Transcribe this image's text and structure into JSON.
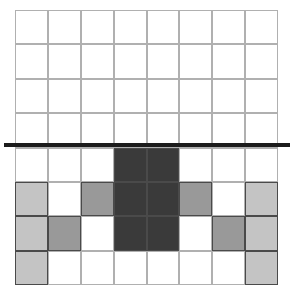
{
  "figure": {
    "name": "shaded-grid-with-threshold-line",
    "canvas": {
      "width": 292,
      "height": 297,
      "background": "#ffffff"
    },
    "grid": {
      "rows": 8,
      "columns": 8,
      "left": 15,
      "top": 10,
      "width": 263,
      "height": 275,
      "cell_width": 32.9,
      "cell_height": 34.4,
      "line_color": "#b0b0b0",
      "shaded_cell_border_color": "#4a4a4a"
    },
    "threshold_line": {
      "label": "threshold-line",
      "y": 145,
      "x_start": 4,
      "x_end": 290,
      "thickness": 4,
      "color": "#1c1c1c",
      "row_index_below": 4,
      "extends_past_grid": true
    },
    "palette": {
      "empty": "#ffffff",
      "light": "#c4c4c4",
      "medium": "#999999",
      "dark": "#3a3a3a"
    },
    "legend_keys": [
      "empty",
      "light",
      "medium",
      "dark"
    ]
  },
  "chart_data": {
    "type": "heatmap",
    "title": "",
    "xlabel": "",
    "ylabel": "",
    "grid": true,
    "legend": "none",
    "categories_x": [
      "1",
      "2",
      "3",
      "4",
      "5",
      "6",
      "7",
      "8"
    ],
    "categories_y": [
      "1",
      "2",
      "3",
      "4",
      "5",
      "6",
      "7",
      "8"
    ],
    "value_levels": {
      "empty": 0,
      "light": 1,
      "medium": 2,
      "dark": 3
    },
    "cells": [
      [
        "empty",
        "empty",
        "empty",
        "empty",
        "empty",
        "empty",
        "empty",
        "empty"
      ],
      [
        "empty",
        "empty",
        "empty",
        "empty",
        "empty",
        "empty",
        "empty",
        "empty"
      ],
      [
        "empty",
        "empty",
        "empty",
        "empty",
        "empty",
        "empty",
        "empty",
        "empty"
      ],
      [
        "empty",
        "empty",
        "empty",
        "empty",
        "empty",
        "empty",
        "empty",
        "empty"
      ],
      [
        "empty",
        "empty",
        "empty",
        "dark",
        "dark",
        "empty",
        "empty",
        "empty"
      ],
      [
        "light",
        "empty",
        "medium",
        "dark",
        "dark",
        "medium",
        "empty",
        "light"
      ],
      [
        "light",
        "medium",
        "empty",
        "dark",
        "dark",
        "empty",
        "medium",
        "light"
      ],
      [
        "light",
        "empty",
        "empty",
        "empty",
        "empty",
        "empty",
        "empty",
        "light"
      ]
    ],
    "values": [
      [
        0,
        0,
        0,
        0,
        0,
        0,
        0,
        0
      ],
      [
        0,
        0,
        0,
        0,
        0,
        0,
        0,
        0
      ],
      [
        0,
        0,
        0,
        0,
        0,
        0,
        0,
        0
      ],
      [
        0,
        0,
        0,
        0,
        0,
        0,
        0,
        0
      ],
      [
        0,
        0,
        0,
        3,
        3,
        0,
        0,
        0
      ],
      [
        1,
        0,
        2,
        3,
        3,
        2,
        0,
        1
      ],
      [
        1,
        2,
        0,
        3,
        3,
        0,
        2,
        1
      ],
      [
        1,
        0,
        0,
        0,
        0,
        0,
        0,
        1
      ]
    ],
    "annotations": [
      {
        "type": "hline",
        "name": "threshold-line",
        "y_row_boundary": 4,
        "color": "#1c1c1c",
        "linewidth": 4,
        "clip_on": false
      }
    ]
  }
}
